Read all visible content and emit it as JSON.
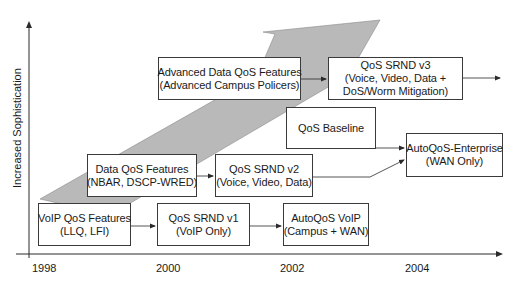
{
  "diagram": {
    "type": "timeline-evolution",
    "y_axis": {
      "label": "Increased Sophistication"
    },
    "x_axis": {
      "ticks": [
        "1998",
        "2000",
        "2002",
        "2004"
      ]
    },
    "colors": {
      "arrow_fill": "#b8b8b8",
      "box_border": "#3a3a3a",
      "line": "#3a3a3a",
      "background": "#ffffff"
    },
    "boxes": {
      "voip_qos": {
        "line1": "VoIP QoS Features",
        "line2": "(LLQ, LFI)"
      },
      "srnd_v1": {
        "line1": "QoS SRND v1",
        "line2": "(VoIP Only)"
      },
      "autoqos_voip": {
        "line1": "AutoQoS VoIP",
        "line2": "(Campus + WAN)"
      },
      "data_qos": {
        "line1": "Data QoS Features",
        "line2": "(NBAR, DSCP-WRED)"
      },
      "srnd_v2": {
        "line1": "QoS SRND v2",
        "line2": "(Voice, Video, Data)"
      },
      "adv_data_qos": {
        "line1": "Advanced Data QoS Features",
        "line2": "(Advanced Campus Policers)"
      },
      "srnd_v3": {
        "line1": "QoS SRND v3",
        "line2": "(Voice, Video, Data +",
        "line3": "DoS/Worm Mitigation)"
      },
      "qos_baseline": {
        "line1": "QoS Baseline"
      },
      "autoqos_enterprise": {
        "line1": "AutoQoS-Enterprise",
        "line2": "(WAN Only)"
      }
    },
    "connections": [
      {
        "from": "VoIP QoS Features",
        "to": "QoS SRND v1"
      },
      {
        "from": "QoS SRND v1",
        "to": "AutoQoS VoIP"
      },
      {
        "from": "Data QoS Features",
        "to": "QoS SRND v2"
      },
      {
        "from": "QoS SRND v2",
        "to": "AutoQoS-Enterprise"
      },
      {
        "from": "QoS Baseline",
        "to": "AutoQoS-Enterprise"
      },
      {
        "from": "Advanced Data QoS Features",
        "to": "QoS SRND v3"
      },
      {
        "from": "QoS SRND v3",
        "to": "(continues)"
      }
    ]
  }
}
